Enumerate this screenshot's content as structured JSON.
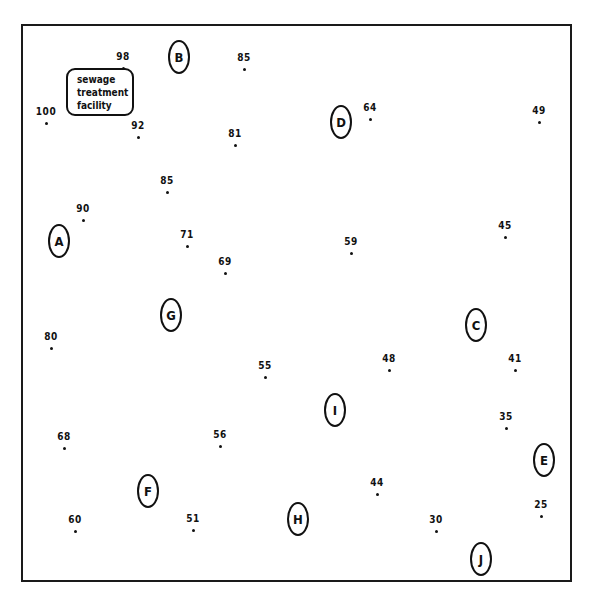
{
  "diagram": {
    "facility": {
      "lines": [
        "sewage",
        "treatment",
        "facility"
      ]
    },
    "sites": [
      {
        "label": "A",
        "x": 59,
        "y": 241
      },
      {
        "label": "B",
        "x": 179,
        "y": 57
      },
      {
        "label": "C",
        "x": 476,
        "y": 325
      },
      {
        "label": "D",
        "x": 341,
        "y": 122
      },
      {
        "label": "E",
        "x": 544,
        "y": 460
      },
      {
        "label": "F",
        "x": 148,
        "y": 491
      },
      {
        "label": "G",
        "x": 171,
        "y": 315
      },
      {
        "label": "H",
        "x": 298,
        "y": 519
      },
      {
        "label": "I",
        "x": 335,
        "y": 410
      },
      {
        "label": "J",
        "x": 481,
        "y": 559
      }
    ],
    "measurements": [
      {
        "value": "98",
        "x": 123,
        "y": 68
      },
      {
        "value": "100",
        "x": 46,
        "y": 123
      },
      {
        "value": "92",
        "x": 138,
        "y": 137
      },
      {
        "value": "85",
        "x": 244,
        "y": 69
      },
      {
        "value": "81",
        "x": 235,
        "y": 145
      },
      {
        "value": "64",
        "x": 370,
        "y": 119
      },
      {
        "value": "49",
        "x": 539,
        "y": 122
      },
      {
        "value": "85",
        "x": 167,
        "y": 192
      },
      {
        "value": "90",
        "x": 83,
        "y": 220
      },
      {
        "value": "71",
        "x": 187,
        "y": 246
      },
      {
        "value": "69",
        "x": 225,
        "y": 273
      },
      {
        "value": "59",
        "x": 351,
        "y": 253
      },
      {
        "value": "45",
        "x": 505,
        "y": 237
      },
      {
        "value": "80",
        "x": 51,
        "y": 348
      },
      {
        "value": "55",
        "x": 265,
        "y": 377
      },
      {
        "value": "48",
        "x": 389,
        "y": 370
      },
      {
        "value": "41",
        "x": 515,
        "y": 370
      },
      {
        "value": "35",
        "x": 506,
        "y": 428
      },
      {
        "value": "68",
        "x": 64,
        "y": 448
      },
      {
        "value": "56",
        "x": 220,
        "y": 446
      },
      {
        "value": "44",
        "x": 377,
        "y": 494
      },
      {
        "value": "60",
        "x": 75,
        "y": 531
      },
      {
        "value": "51",
        "x": 193,
        "y": 530
      },
      {
        "value": "30",
        "x": 436,
        "y": 531
      },
      {
        "value": "25",
        "x": 541,
        "y": 516
      }
    ]
  }
}
